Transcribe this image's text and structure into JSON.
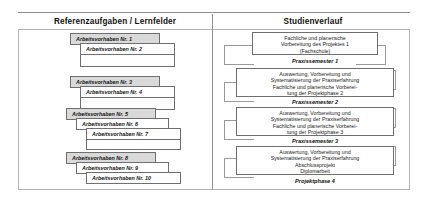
{
  "diagram": {
    "headers": {
      "left": "Referenzaufgaben / Lernfelder",
      "right": "Studienverlauf"
    },
    "left_column": {
      "groups": [
        {
          "items": [
            "Arbeitsvorhaben Nr. 1",
            "Arbeitsvorhaben Nr. 2"
          ]
        },
        {
          "items": [
            "Arbeitsvorhaben Nr. 3",
            "Arbeitsvorhaben Nr. 4"
          ]
        },
        {
          "items": [
            "Arbeitsvorhaben Nr. 5",
            "Arbeitsvorhaben Nr. 6",
            "Arbeitsvorhaben Nr. 7"
          ]
        },
        {
          "items": [
            "Arbeitsvorhaben Nr. 8",
            "Arbeitsvorhaben Nr. 9",
            "Arbeitsvorhaben Nr. 10"
          ]
        }
      ],
      "tasks": [
        "Arbeitsvorhaben Nr. 1",
        "Arbeitsvorhaben Nr. 2",
        "Arbeitsvorhaben Nr. 3",
        "Arbeitsvorhaben Nr. 4",
        "Arbeitsvorhaben Nr. 5",
        "Arbeitsvorhaben Nr. 6",
        "Arbeitsvorhaben Nr. 7",
        "Arbeitsvorhaben Nr. 8",
        "Arbeitsvorhaben Nr. 9",
        "Arbeitsvorhaben Nr. 10"
      ]
    },
    "right_column": {
      "phase_1": {
        "line1": "Fachliche und planerische",
        "line2": "Vorbereitung des Projektes 1",
        "line3": "(Fachschule)"
      },
      "semester_1": "Praxissemester 1",
      "phase_2": {
        "line1": "Auswertung, Vorbereitung und",
        "line2": "Systematisierung der Praxiserfahrung",
        "line3": "Fachliche und planerische Vorberei-",
        "line4": "tung der Projektphase 2"
      },
      "semester_2": "Praxissemester 2",
      "phase_3": {
        "line1": "Auswertung, Vorbereitung und",
        "line2": "Systematisierung der Praxiserfahrung",
        "line3": "Fachliche und planerische Vorberei-",
        "line4": "tung der Projektphase 3"
      },
      "semester_3": "Praxissemester 3",
      "phase_4": {
        "line1": "Auswertung, Vorbereitung und",
        "line2": "Systematisierung der Praxiserfahrung",
        "line3": "Abschlussprojekt",
        "line4": "Diplomarbeit"
      },
      "semester_4": "Projektphase 4"
    },
    "colors": {
      "box_border": "#6f6f6f",
      "shaded_fill": "#d9d9d9",
      "frame_border": "#b3b3b3",
      "connector": "#9a9a9a"
    }
  }
}
